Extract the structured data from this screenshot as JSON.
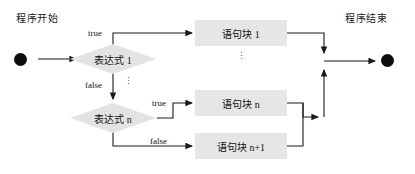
{
  "diagram": {
    "title_start": "程序开始",
    "title_end": "程序结束",
    "start_node": "start-dot",
    "end_node": "end-dot",
    "decisions": [
      {
        "label": "表达式 1"
      },
      {
        "label": "表达式 n"
      }
    ],
    "blocks": [
      {
        "label": "语句块 1"
      },
      {
        "label": "语句块 n"
      },
      {
        "label": "语句块 n+1"
      }
    ],
    "edge_labels": {
      "true_1": "true",
      "false_1": "false",
      "true_n": "true",
      "false_n": "false"
    },
    "ellipsis": {
      "decision_chain": "⋮",
      "block_chain": "⋮"
    },
    "colors": {
      "box_fill": "#e6e6e6",
      "decision_fill": "#e3e3e3",
      "line": "#1a1a1a",
      "terminal": "#0d0d0d",
      "text": "#111111"
    }
  }
}
